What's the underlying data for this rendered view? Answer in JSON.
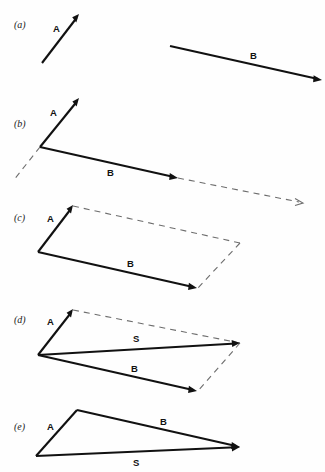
{
  "figure": {
    "background_color": "#fefefe",
    "line_color": "#111111",
    "dashed_color": "#6d6d6d",
    "width": 325,
    "height": 472
  },
  "panels": [
    {
      "id": "a",
      "label": "(a)",
      "label_pos": {
        "x": 14,
        "y": 28
      },
      "vectors": [
        {
          "name": "A",
          "style": "solid",
          "label": "A",
          "label_pos": {
            "x": 53,
            "y": 32
          },
          "start": {
            "x": 42,
            "y": 63
          },
          "end": {
            "x": 79,
            "y": 14
          }
        },
        {
          "name": "B",
          "style": "solid",
          "label": "B",
          "label_pos": {
            "x": 250,
            "y": 59
          },
          "start": {
            "x": 170,
            "y": 46
          },
          "end": {
            "x": 322,
            "y": 80
          }
        }
      ]
    },
    {
      "id": "b",
      "label": "(b)",
      "label_pos": {
        "x": 14,
        "y": 127
      },
      "vectors": [
        {
          "name": "A",
          "style": "solid",
          "label": "A",
          "label_pos": {
            "x": 50,
            "y": 116
          },
          "start": {
            "x": 40,
            "y": 147
          },
          "end": {
            "x": 79,
            "y": 98
          }
        },
        {
          "name": "B",
          "style": "solid",
          "label": "B",
          "label_pos": {
            "x": 107,
            "y": 176
          },
          "start": {
            "x": 40,
            "y": 147
          },
          "end": {
            "x": 178,
            "y": 178
          }
        },
        {
          "name": "A-extension",
          "style": "dashed",
          "label": "",
          "start": {
            "x": 40,
            "y": 147
          },
          "end": {
            "x": 13,
            "y": 180
          }
        },
        {
          "name": "B-extension",
          "style": "dashed-arrow",
          "label": "",
          "start": {
            "x": 178,
            "y": 178
          },
          "end": {
            "x": 303,
            "y": 203
          }
        }
      ]
    },
    {
      "id": "c",
      "label": "(c)",
      "label_pos": {
        "x": 14,
        "y": 221
      },
      "vectors": [
        {
          "name": "A",
          "style": "solid",
          "label": "A",
          "label_pos": {
            "x": 47,
            "y": 222
          },
          "start": {
            "x": 38,
            "y": 252
          },
          "end": {
            "x": 73,
            "y": 205
          }
        },
        {
          "name": "B",
          "style": "solid",
          "label": "B",
          "label_pos": {
            "x": 127,
            "y": 267
          },
          "start": {
            "x": 38,
            "y": 252
          },
          "end": {
            "x": 197,
            "y": 288
          }
        },
        {
          "name": "parallel-B-top",
          "style": "dashed",
          "label": "",
          "start": {
            "x": 73,
            "y": 205
          },
          "end": {
            "x": 240,
            "y": 243
          }
        },
        {
          "name": "parallel-A-right",
          "style": "dashed",
          "label": "",
          "start": {
            "x": 197,
            "y": 288
          },
          "end": {
            "x": 240,
            "y": 243
          }
        }
      ]
    },
    {
      "id": "d",
      "label": "(d)",
      "label_pos": {
        "x": 14,
        "y": 323
      },
      "vectors": [
        {
          "name": "A",
          "style": "solid",
          "label": "A",
          "label_pos": {
            "x": 47,
            "y": 325
          },
          "start": {
            "x": 38,
            "y": 355
          },
          "end": {
            "x": 73,
            "y": 309
          }
        },
        {
          "name": "S",
          "style": "solid",
          "label": "S",
          "label_pos": {
            "x": 133,
            "y": 342
          },
          "start": {
            "x": 38,
            "y": 355
          },
          "end": {
            "x": 240,
            "y": 343
          }
        },
        {
          "name": "B",
          "style": "solid",
          "label": "B",
          "label_pos": {
            "x": 131,
            "y": 372
          },
          "start": {
            "x": 38,
            "y": 355
          },
          "end": {
            "x": 197,
            "y": 391
          }
        },
        {
          "name": "parallel-B-top",
          "style": "dashed",
          "label": "",
          "start": {
            "x": 73,
            "y": 309
          },
          "end": {
            "x": 240,
            "y": 343
          }
        },
        {
          "name": "parallel-A-right",
          "style": "dashed",
          "label": "",
          "start": {
            "x": 197,
            "y": 391
          },
          "end": {
            "x": 240,
            "y": 343
          }
        }
      ]
    },
    {
      "id": "e",
      "label": "(e)",
      "label_pos": {
        "x": 14,
        "y": 430
      },
      "vectors": [
        {
          "name": "A",
          "style": "solid",
          "label": "A",
          "label_pos": {
            "x": 47,
            "y": 430
          },
          "start": {
            "x": 36,
            "y": 456
          },
          "end": {
            "x": 77,
            "y": 410
          }
        },
        {
          "name": "B",
          "style": "solid",
          "label": "B",
          "label_pos": {
            "x": 160,
            "y": 425
          },
          "start": {
            "x": 77,
            "y": 410
          },
          "end": {
            "x": 240,
            "y": 447
          }
        },
        {
          "name": "S",
          "style": "solid",
          "label": "S",
          "label_pos": {
            "x": 133,
            "y": 466
          },
          "start": {
            "x": 36,
            "y": 456
          },
          "end": {
            "x": 240,
            "y": 447
          }
        }
      ]
    }
  ]
}
